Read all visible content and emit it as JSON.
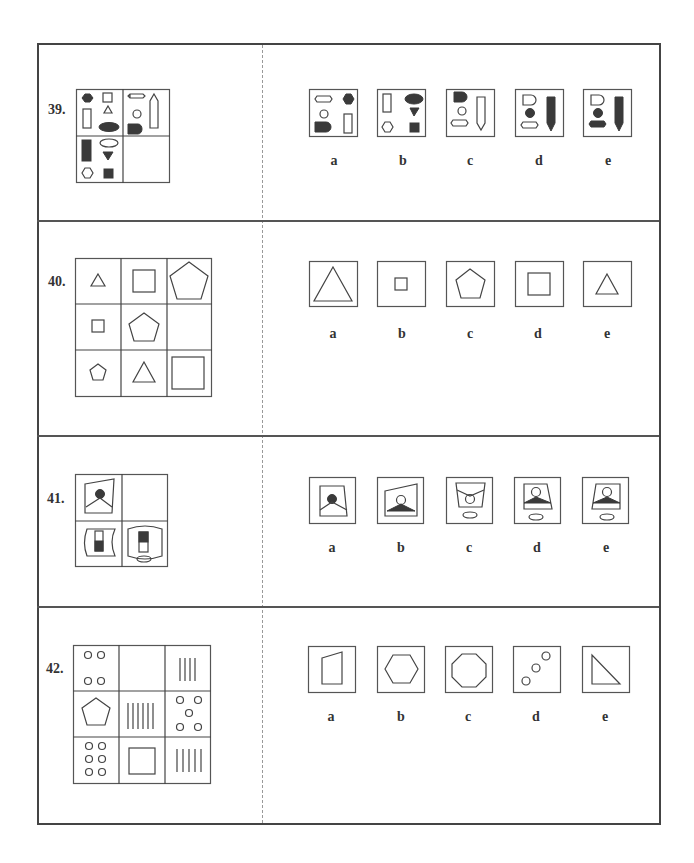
{
  "page": {
    "questions": [
      {
        "number": "39.",
        "type": "matrix-2x2",
        "matrix_cells": [
          "filled hexagon, square, rectangle, triangle, filled ellipse",
          "wavy rectangle, circle, pencil shape, filled half-round",
          "filled rectangle, ellipse, filled triangle, hexagon, filled square",
          "empty (missing)"
        ],
        "options": [
          {
            "label": "a",
            "desc": "wavy rectangle, filled hexagon, circle, filled half-round, rectangle"
          },
          {
            "label": "b",
            "desc": "rectangle, filled ellipse, filled triangle, hexagon, filled square"
          },
          {
            "label": "c",
            "desc": "filled half-round, circle, wavy rectangle, pencil"
          },
          {
            "label": "d",
            "desc": "half-round, filled circle, wavy rectangle, filled pencil"
          },
          {
            "label": "e",
            "desc": "half-round, filled circle, filled wavy rectangle, filled pencil"
          }
        ]
      },
      {
        "number": "40.",
        "type": "matrix-3x3",
        "matrix_cells": [
          "small triangle",
          "medium square",
          "large pentagon",
          "small square",
          "medium pentagon",
          "empty (missing)",
          "small pentagon",
          "medium triangle",
          "large square"
        ],
        "options": [
          {
            "label": "a",
            "desc": "large triangle"
          },
          {
            "label": "b",
            "desc": "small square"
          },
          {
            "label": "c",
            "desc": "medium pentagon"
          },
          {
            "label": "d",
            "desc": "medium square"
          },
          {
            "label": "e",
            "desc": "medium triangle"
          }
        ]
      },
      {
        "number": "41.",
        "type": "matrix-2x2",
        "matrix_cells": [
          "trapezoid frame with filled circle and hanger",
          "empty (missing)",
          "curved frame with half-filled rectangle",
          "cylinder with half-filled rectangle and ellipse base"
        ],
        "options": [
          {
            "label": "a",
            "desc": "trapezoid, filled circle, hanger lines"
          },
          {
            "label": "b",
            "desc": "skewed trapezoid, hollow circle, filled mound"
          },
          {
            "label": "c",
            "desc": "inverted trapezoid, hollow circle, V lines, ellipse"
          },
          {
            "label": "d",
            "desc": "trapezoid, hollow circle, filled mound, ellipse"
          },
          {
            "label": "e",
            "desc": "trapezoid, hollow circle, filled mound, ellipse"
          }
        ]
      },
      {
        "number": "42.",
        "type": "matrix-3x3",
        "matrix_cells": [
          "4 circles",
          "empty (missing)",
          "4 vertical lines",
          "pentagon",
          "6 vertical lines",
          "5 circles",
          "6 circles",
          "square",
          "5 vertical lines"
        ],
        "options": [
          {
            "label": "a",
            "desc": "quadrilateral (trapezoid)"
          },
          {
            "label": "b",
            "desc": "hexagon"
          },
          {
            "label": "c",
            "desc": "octagon"
          },
          {
            "label": "d",
            "desc": "3 circles diagonal"
          },
          {
            "label": "e",
            "desc": "right triangle"
          }
        ]
      }
    ]
  }
}
